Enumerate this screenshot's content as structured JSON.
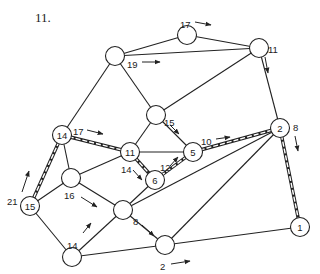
{
  "problem_number": "11.",
  "nodes": [
    {
      "id": "A",
      "label": "",
      "x": 115,
      "y": 56
    },
    {
      "id": "B",
      "label": "",
      "x": 187,
      "y": 35
    },
    {
      "id": "C",
      "label": "",
      "x": 259,
      "y": 48
    },
    {
      "id": "D",
      "label": "",
      "x": 156,
      "y": 115
    },
    {
      "id": "N2",
      "label": "2",
      "x": 280,
      "y": 128
    },
    {
      "id": "N14",
      "label": "14",
      "x": 62,
      "y": 135
    },
    {
      "id": "N11",
      "label": "11",
      "x": 130,
      "y": 152
    },
    {
      "id": "N5",
      "label": "5",
      "x": 193,
      "y": 152
    },
    {
      "id": "N6",
      "label": "6",
      "x": 155,
      "y": 180
    },
    {
      "id": "E",
      "label": "",
      "x": 71,
      "y": 178
    },
    {
      "id": "N15",
      "label": "15",
      "x": 30,
      "y": 206
    },
    {
      "id": "F",
      "label": "",
      "x": 123,
      "y": 210
    },
    {
      "id": "G",
      "label": "",
      "x": 72,
      "y": 257
    },
    {
      "id": "H",
      "label": "",
      "x": 165,
      "y": 245
    },
    {
      "id": "N1",
      "label": "1",
      "x": 300,
      "y": 227
    }
  ],
  "edges": [
    {
      "from": "A",
      "to": "B",
      "double": false
    },
    {
      "from": "A",
      "to": "C",
      "double": false
    },
    {
      "from": "B",
      "to": "C",
      "double": false
    },
    {
      "from": "A",
      "to": "N14",
      "double": false
    },
    {
      "from": "A",
      "to": "D",
      "double": false
    },
    {
      "from": "C",
      "to": "D",
      "double": false
    },
    {
      "from": "C",
      "to": "N2",
      "double": false
    },
    {
      "from": "D",
      "to": "N11",
      "double": false
    },
    {
      "from": "D",
      "to": "N5",
      "double": false
    },
    {
      "from": "N14",
      "to": "N11",
      "double": true
    },
    {
      "from": "N14",
      "to": "E",
      "double": false
    },
    {
      "from": "N14",
      "to": "N15",
      "double": true
    },
    {
      "from": "N11",
      "to": "N5",
      "double": false
    },
    {
      "from": "N11",
      "to": "N6",
      "double": true
    },
    {
      "from": "N11",
      "to": "E",
      "double": false
    },
    {
      "from": "N6",
      "to": "N5",
      "double": true
    },
    {
      "from": "N5",
      "to": "N2",
      "double": true
    },
    {
      "from": "N2",
      "to": "N1",
      "double": true
    },
    {
      "from": "N2",
      "to": "F",
      "double": false
    },
    {
      "from": "N2",
      "to": "H",
      "double": false
    },
    {
      "from": "N6",
      "to": "F",
      "double": false
    },
    {
      "from": "E",
      "to": "N15",
      "double": false
    },
    {
      "from": "E",
      "to": "F",
      "double": false
    },
    {
      "from": "N15",
      "to": "G",
      "double": false
    },
    {
      "from": "G",
      "to": "F",
      "double": false
    },
    {
      "from": "G",
      "to": "H",
      "double": false
    },
    {
      "from": "F",
      "to": "H",
      "double": false
    },
    {
      "from": "H",
      "to": "N1",
      "double": false
    }
  ],
  "edge_labels": [
    {
      "text": "17",
      "x": 180,
      "y": 24,
      "ax1": 195,
      "ay1": 22,
      "ax2": 211,
      "ay2": 25
    },
    {
      "text": "19",
      "x": 127,
      "y": 64,
      "ax1": 142,
      "ay1": 62,
      "ax2": 160,
      "ay2": 62
    },
    {
      "text": "11",
      "x": 268,
      "y": 49,
      "ax1": 265,
      "ay1": 57,
      "ax2": 268,
      "ay2": 73
    },
    {
      "text": "15",
      "x": 164,
      "y": 122,
      "ax1": 170,
      "ay1": 125,
      "ax2": 179,
      "ay2": 134
    },
    {
      "text": "8",
      "x": 293,
      "y": 127,
      "ax1": 295,
      "ay1": 136,
      "ax2": 298,
      "ay2": 151
    },
    {
      "text": "10",
      "x": 201,
      "y": 141,
      "ax1": 216,
      "ay1": 139,
      "ax2": 230,
      "ay2": 137
    },
    {
      "text": "17",
      "x": 73,
      "y": 131,
      "ax1": 87,
      "ay1": 130,
      "ax2": 103,
      "ay2": 134
    },
    {
      "text": "14",
      "x": 121,
      "y": 169,
      "ax1": 133,
      "ay1": 170,
      "ax2": 142,
      "ay2": 180
    },
    {
      "text": "12",
      "x": 160,
      "y": 167,
      "ax1": 170,
      "ay1": 166,
      "ax2": 178,
      "ay2": 157
    },
    {
      "text": "21",
      "x": 7,
      "y": 201,
      "ax1": 22,
      "ay1": 192,
      "ax2": 29,
      "ay2": 171
    },
    {
      "text": "16",
      "x": 64,
      "y": 195,
      "ax1": 81,
      "ay1": 197,
      "ax2": 97,
      "ay2": 207
    },
    {
      "text": "8",
      "x": 133,
      "y": 221,
      "ax1": 142,
      "ay1": 225,
      "ax2": 154,
      "ay2": 236
    },
    {
      "text": "14",
      "x": 67,
      "y": 245,
      "ax1": 83,
      "ay1": 233,
      "ax2": 91,
      "ay2": 223
    },
    {
      "text": "2",
      "x": 160,
      "y": 266,
      "ax1": 171,
      "ay1": 264,
      "ax2": 190,
      "ay2": 261
    }
  ]
}
